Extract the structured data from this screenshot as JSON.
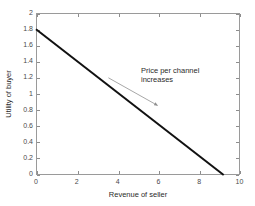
{
  "chart_data": {
    "type": "line",
    "title": "",
    "xlabel": "Revenue of seller",
    "ylabel": "Utility of buyer",
    "xlim": [
      0,
      10
    ],
    "ylim": [
      0,
      2
    ],
    "xticks": [
      "0",
      "2",
      "4",
      "6",
      "8",
      "10"
    ],
    "xtick_values": [
      0,
      2,
      4,
      6,
      8,
      10
    ],
    "yticks": [
      "0",
      "0.2",
      "0.4",
      "0.6",
      "0.8",
      "1",
      "1.2",
      "1.4",
      "1.6",
      "1.8",
      "2"
    ],
    "ytick_values": [
      0,
      0.2,
      0.4,
      0.6,
      0.8,
      1,
      1.2,
      1.4,
      1.6,
      1.8,
      2
    ],
    "grid": false,
    "legend": null,
    "series": [
      {
        "name": "utility-revenue-tradeoff",
        "color": "#111111",
        "linewidth": 2,
        "x": [
          0,
          9.2
        ],
        "y": [
          1.8,
          0
        ]
      }
    ],
    "annotations": [
      {
        "name": "price-per-channel-increases",
        "lines": [
          "Price per channel",
          "increases"
        ],
        "arrow": {
          "from_x": 3.55,
          "from_y": 1.2,
          "to_x": 5.95,
          "to_y": 0.86,
          "color": "#9d9d9d"
        }
      }
    ],
    "axis_color": "#9a9a9a",
    "background": "#ffffff"
  }
}
